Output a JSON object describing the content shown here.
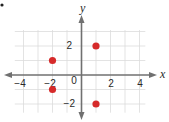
{
  "chart_data": {
    "type": "scatter",
    "title": "",
    "xlabel": "x",
    "ylabel": "y",
    "xlim": [
      -4.5,
      4.5
    ],
    "ylim": [
      -2.9,
      3.0
    ],
    "grid": true,
    "x_ticks": [
      -4,
      -2,
      0,
      2,
      4
    ],
    "y_ticks": [
      2,
      -2
    ],
    "origin_label": "0",
    "points": [
      {
        "x": -2,
        "y": 1
      },
      {
        "x": -2,
        "y": -1
      },
      {
        "x": 1,
        "y": 2
      },
      {
        "x": 1,
        "y": -2
      }
    ],
    "point_color": "#d62a2a",
    "axis_color": "#707070",
    "grid_color": "#dcdcdc"
  },
  "labels": {
    "x_axis": "x",
    "y_axis": "y",
    "x_ticks": [
      "−4",
      "−2",
      "2",
      "4"
    ],
    "y_ticks": [
      "2",
      "−2"
    ],
    "origin": "0"
  }
}
